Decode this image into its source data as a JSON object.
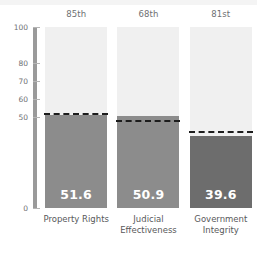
{
  "chart_data": {
    "type": "bar",
    "title": "",
    "xlabel": "",
    "ylabel": "",
    "ylim": [
      0,
      100
    ],
    "grid": false,
    "legend_position": "none",
    "categories": [
      "Property Rights",
      "Judicial Effectiveness",
      "Government Integrity"
    ],
    "values": [
      51.6,
      50.9,
      39.6
    ],
    "value_labels": [
      "51.6",
      "50.9",
      "39.6"
    ],
    "percentile_labels": [
      "85th",
      "68th",
      "81st"
    ],
    "benchmark_values": [
      51.6,
      47.5,
      41.5
    ],
    "ytick_labels": [
      "100",
      "80",
      "70",
      "60",
      "50",
      "0"
    ],
    "ytick_values": [
      100,
      80,
      70,
      60,
      50,
      0
    ],
    "series": [
      {
        "name": "Score",
        "values": [
          51.6,
          50.9,
          39.6
        ]
      },
      {
        "name": "Benchmark",
        "values": [
          51.6,
          47.5,
          41.5
        ]
      }
    ],
    "colors": {
      "bar_default": "#8c8c8c",
      "bar_highlight": "#6d6d6d",
      "column_background": "#f0f0f0",
      "axis": "#9a9a9a",
      "benchmark_line": "#1d1d1d",
      "value_text": "#ffffff",
      "tick_text": "#6e7073",
      "category_text": "#58595b"
    },
    "bar_colors": [
      "#8c8c8c",
      "#8c8c8c",
      "#6d6d6d"
    ]
  }
}
